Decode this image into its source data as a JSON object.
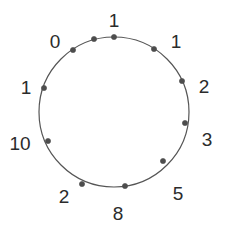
{
  "figure": {
    "kind": "cycle-graph",
    "width": 229,
    "height": 236,
    "background_color": "#ffffff",
    "edge_color": "#555555",
    "node_color": "#4d4d4d",
    "label_color": "#2b2b2b",
    "circle": {
      "center_x": 114,
      "center_y": 112,
      "radius": 75,
      "stroke_width": 1.2
    },
    "node_radius": 2.6,
    "node_count": 11
  },
  "chart_data": {
    "type": "scatter",
    "title": "",
    "xlabel": "",
    "ylabel": "",
    "layout": "circular",
    "node_count": 11,
    "categories": [
      "n0",
      "n1",
      "n2",
      "n3",
      "n4",
      "n5",
      "n6",
      "n7",
      "n8",
      "n9",
      "n10"
    ],
    "values": [
      1,
      1,
      2,
      3,
      5,
      8,
      2,
      10,
      1,
      0,
      1
    ],
    "labels_clockwise_from_top": [
      "1",
      "1",
      "2",
      "3",
      "5",
      "8",
      "2",
      "10",
      "1",
      "0"
    ],
    "annotations": [
      "1",
      "1",
      "2",
      "3",
      "5",
      "8",
      "2",
      "10",
      "1",
      "0"
    ]
  },
  "nodes": [
    {
      "id": "node-top",
      "label": "1",
      "angle_deg": 0,
      "node_x": 114,
      "node_y": 37,
      "label_x": 114,
      "label_y": 20
    },
    {
      "id": "node-upper-right",
      "label": "1",
      "angle_deg": 32.73,
      "node_x": 154,
      "node_y": 49,
      "label_x": 176,
      "label_y": 41
    },
    {
      "id": "node-right-upper",
      "label": "2",
      "angle_deg": 65.45,
      "node_x": 182,
      "node_y": 81,
      "label_x": 204,
      "label_y": 86
    },
    {
      "id": "node-right-lower",
      "label": "3",
      "angle_deg": 98.18,
      "node_x": 185,
      "node_y": 123,
      "label_x": 207,
      "label_y": 139
    },
    {
      "id": "node-lower-right",
      "label": "5",
      "angle_deg": 130.91,
      "node_x": 163,
      "node_y": 161,
      "label_x": 178,
      "label_y": 193
    },
    {
      "id": "node-bottom",
      "label": "8",
      "angle_deg": 163.64,
      "node_x": 125,
      "node_y": 186,
      "label_x": 118,
      "label_y": 213
    },
    {
      "id": "node-lower-left",
      "label": "2",
      "angle_deg": 196.36,
      "node_x": 82,
      "node_y": 184,
      "label_x": 64,
      "label_y": 196
    },
    {
      "id": "node-left-lower",
      "label": "10",
      "angle_deg": 229.09,
      "node_x": 48,
      "node_y": 141,
      "label_x": 20,
      "label_y": 143
    },
    {
      "id": "node-left-upper",
      "label": "1",
      "angle_deg": 261.82,
      "node_x": 44,
      "node_y": 88,
      "label_x": 26,
      "label_y": 87
    },
    {
      "id": "node-upper-left",
      "label": "0",
      "angle_deg": 294.55,
      "node_x": 73,
      "node_y": 50,
      "label_x": 55,
      "label_y": 41
    },
    {
      "id": "node-top-left-arc",
      "label": "",
      "angle_deg": 327.27,
      "node_x": 94,
      "node_y": 39,
      "label_x": 94,
      "label_y": 39
    }
  ]
}
